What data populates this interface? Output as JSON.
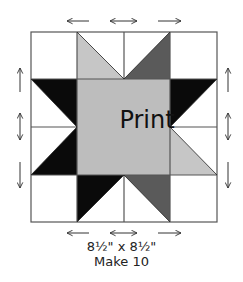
{
  "block": {
    "center_label": "Print",
    "size_label": "8½\" x 8½\"",
    "quantity_label": "Make 10"
  },
  "colors": {
    "background": "#ffffff",
    "outline": "#555555",
    "center_fill": "#bdbdbd",
    "light_grey": "#c6c6c6",
    "dark_grey": "#5a5a5a",
    "black": "#0a0a0a"
  },
  "grid": {
    "rows": 4,
    "cols": 4,
    "pieces": [
      {
        "row": 1,
        "col": 2,
        "fill": "light_grey",
        "shape": "half-square-triangle"
      },
      {
        "row": 1,
        "col": 3,
        "fill": "dark_grey",
        "shape": "half-square-triangle"
      },
      {
        "row": 2,
        "col": 1,
        "fill": "black",
        "shape": "half-square-triangle"
      },
      {
        "row": 2,
        "col": 4,
        "fill": "black",
        "shape": "half-square-triangle"
      },
      {
        "row": 3,
        "col": 1,
        "fill": "black",
        "shape": "half-square-triangle"
      },
      {
        "row": 3,
        "col": 4,
        "fill": "light_grey",
        "shape": "half-square-triangle"
      },
      {
        "row": 4,
        "col": 2,
        "fill": "black",
        "shape": "half-square-triangle"
      },
      {
        "row": 4,
        "col": 3,
        "fill": "dark_grey",
        "shape": "half-square-triangle"
      },
      {
        "row": "2-3",
        "col": "2-3",
        "fill": "center_fill",
        "shape": "square"
      }
    ]
  },
  "pressing_arrows": {
    "top": [
      "left",
      "both",
      "right"
    ],
    "bottom": [
      "left",
      "both",
      "right"
    ],
    "left": [
      "up",
      "both",
      "down"
    ],
    "right": [
      "up",
      "both",
      "down"
    ]
  }
}
